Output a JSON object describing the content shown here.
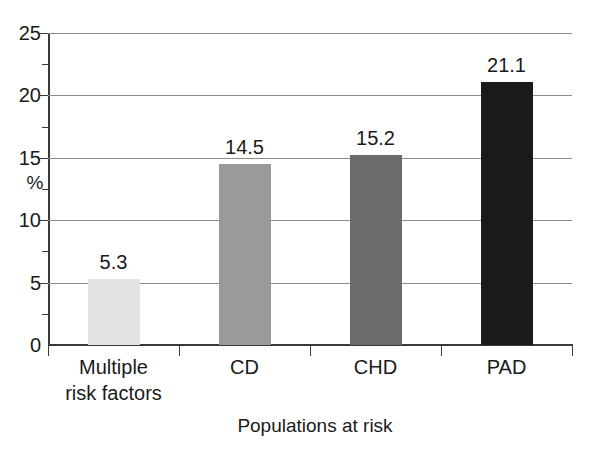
{
  "chart_data": {
    "type": "bar",
    "title": "",
    "xlabel": "Populations at risk",
    "ylabel": "%",
    "categories": [
      "Multiple\nrisk factors",
      "CD",
      "CHD",
      "PAD"
    ],
    "category_labels_flat": [
      "Multiple risk factors",
      "CD",
      "CHD",
      "PAD"
    ],
    "values": [
      5.3,
      14.5,
      15.2,
      21.1
    ],
    "value_labels": [
      "5.3",
      "14.5",
      "15.2",
      "21.1"
    ],
    "bar_colors": [
      "#e3e3e3",
      "#9a9a9a",
      "#6b6b6b",
      "#1a1a1a"
    ],
    "ylim": [
      0,
      25
    ],
    "ytick_labels": [
      "0",
      "5",
      "10",
      "15",
      "20",
      "25"
    ],
    "ytick_values": [
      0,
      5,
      10,
      15,
      20,
      25
    ],
    "y_minor_ticks": [
      2.5,
      7.5,
      12.5,
      17.5,
      22.5
    ],
    "grid": "horizontal",
    "gridline_color": "#8c8c8c",
    "axis_color": "#3a3a3a",
    "legend": "none",
    "background": "#ffffff"
  }
}
